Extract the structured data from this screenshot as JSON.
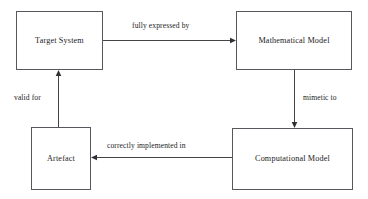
{
  "diagram": {
    "nodes": [
      {
        "id": "target-system",
        "label": "Target System"
      },
      {
        "id": "mathematical-model",
        "label": "Mathematical Model"
      },
      {
        "id": "artefact",
        "label": "Artefact"
      },
      {
        "id": "computational-model",
        "label": "Computational Model"
      }
    ],
    "edges": [
      {
        "id": "edge-fully-expressed-by",
        "label": "fully expressed by",
        "from": "target-system",
        "to": "mathematical-model",
        "direction": "right"
      },
      {
        "id": "edge-mimetic-to",
        "label": "mimetic to",
        "from": "mathematical-model",
        "to": "computational-model",
        "direction": "down"
      },
      {
        "id": "edge-correctly-implemented",
        "label": "correctly implemented in",
        "from": "computational-model",
        "to": "artefact",
        "direction": "left"
      },
      {
        "id": "edge-valid-for",
        "label": "valid for",
        "from": "artefact",
        "to": "target-system",
        "direction": "up"
      }
    ],
    "colors": {
      "background": "#ffffff",
      "box_border": "#55585c",
      "arrow": "#2e3033",
      "text": "#1c1c1c"
    }
  }
}
